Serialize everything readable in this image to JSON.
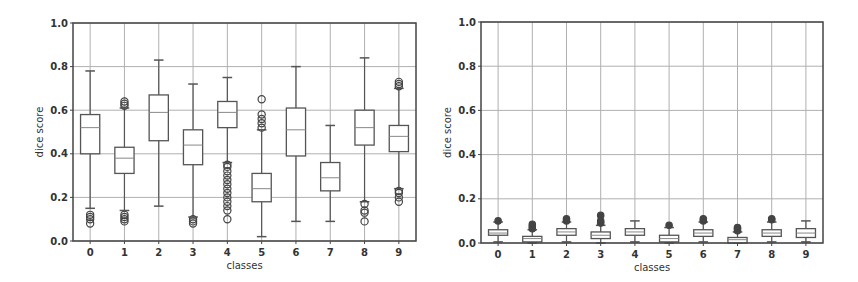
{
  "chart_data": [
    {
      "type": "box",
      "title": "",
      "xlabel": "classes",
      "ylabel": "dice score",
      "ylim": [
        0.0,
        1.0
      ],
      "yticks": [
        "0.0",
        "0.2",
        "0.4",
        "0.6",
        "0.8",
        "1.0"
      ],
      "categories": [
        "0",
        "1",
        "2",
        "3",
        "4",
        "5",
        "6",
        "7",
        "8",
        "9"
      ],
      "grid": true,
      "boxes": [
        {
          "class": "0",
          "whislo": 0.15,
          "q1": 0.4,
          "median": 0.52,
          "q3": 0.58,
          "whishi": 0.78,
          "fliers": [
            0.08,
            0.1,
            0.11,
            0.12
          ]
        },
        {
          "class": "1",
          "whislo": 0.14,
          "q1": 0.31,
          "median": 0.38,
          "q3": 0.43,
          "whishi": 0.61,
          "fliers": [
            0.09,
            0.1,
            0.11,
            0.12,
            0.62,
            0.63,
            0.64
          ]
        },
        {
          "class": "2",
          "whislo": 0.16,
          "q1": 0.46,
          "median": 0.59,
          "q3": 0.67,
          "whishi": 0.83,
          "fliers": []
        },
        {
          "class": "3",
          "whislo": 0.11,
          "q1": 0.35,
          "median": 0.44,
          "q3": 0.51,
          "whishi": 0.72,
          "fliers": [
            0.08,
            0.09,
            0.1
          ]
        },
        {
          "class": "4",
          "whislo": 0.36,
          "q1": 0.52,
          "median": 0.59,
          "q3": 0.64,
          "whishi": 0.75,
          "fliers": [
            0.1,
            0.14,
            0.16,
            0.18,
            0.2,
            0.22,
            0.24,
            0.26,
            0.28,
            0.3,
            0.32,
            0.34,
            0.35
          ]
        },
        {
          "class": "5",
          "whislo": 0.02,
          "q1": 0.18,
          "median": 0.24,
          "q3": 0.31,
          "whishi": 0.51,
          "fliers": [
            0.52,
            0.54,
            0.56,
            0.58,
            0.65
          ]
        },
        {
          "class": "6",
          "whislo": 0.09,
          "q1": 0.39,
          "median": 0.51,
          "q3": 0.61,
          "whishi": 0.8,
          "fliers": []
        },
        {
          "class": "7",
          "whislo": 0.09,
          "q1": 0.23,
          "median": 0.29,
          "q3": 0.36,
          "whishi": 0.53,
          "fliers": []
        },
        {
          "class": "8",
          "whislo": 0.18,
          "q1": 0.44,
          "median": 0.52,
          "q3": 0.6,
          "whishi": 0.84,
          "fliers": [
            0.09,
            0.13,
            0.14,
            0.17
          ]
        },
        {
          "class": "9",
          "whislo": 0.24,
          "q1": 0.41,
          "median": 0.48,
          "q3": 0.53,
          "whishi": 0.7,
          "fliers": [
            0.18,
            0.2,
            0.22,
            0.23,
            0.71,
            0.72,
            0.73
          ]
        }
      ]
    },
    {
      "type": "box",
      "title": "",
      "xlabel": "classes",
      "ylabel": "dice score",
      "ylim": [
        0.0,
        1.0
      ],
      "yticks": [
        "0.0",
        "0.2",
        "0.4",
        "0.6",
        "0.8",
        "1.0"
      ],
      "categories": [
        "0",
        "1",
        "2",
        "3",
        "4",
        "5",
        "6",
        "7",
        "8",
        "9"
      ],
      "grid": true,
      "boxes": [
        {
          "class": "0",
          "whislo": 0.005,
          "q1": 0.035,
          "median": 0.045,
          "q3": 0.06,
          "whishi": 0.095,
          "fliers": [
            0.1
          ]
        },
        {
          "class": "1",
          "whislo": 0.0,
          "q1": 0.005,
          "median": 0.02,
          "q3": 0.03,
          "whishi": 0.06,
          "fliers": [
            0.065,
            0.075,
            0.085
          ]
        },
        {
          "class": "2",
          "whislo": 0.005,
          "q1": 0.035,
          "median": 0.05,
          "q3": 0.065,
          "whishi": 0.095,
          "fliers": [
            0.1,
            0.11
          ]
        },
        {
          "class": "3",
          "whislo": 0.0,
          "q1": 0.02,
          "median": 0.035,
          "q3": 0.05,
          "whishi": 0.08,
          "fliers": [
            0.09,
            0.1,
            0.125
          ]
        },
        {
          "class": "4",
          "whislo": 0.005,
          "q1": 0.035,
          "median": 0.05,
          "q3": 0.065,
          "whishi": 0.1,
          "fliers": []
        },
        {
          "class": "5",
          "whislo": 0.0,
          "q1": 0.005,
          "median": 0.02,
          "q3": 0.035,
          "whishi": 0.07,
          "fliers": [
            0.08
          ]
        },
        {
          "class": "6",
          "whislo": 0.005,
          "q1": 0.03,
          "median": 0.045,
          "q3": 0.06,
          "whishi": 0.095,
          "fliers": [
            0.1,
            0.11
          ]
        },
        {
          "class": "7",
          "whislo": 0.0,
          "q1": 0.0,
          "median": 0.015,
          "q3": 0.025,
          "whishi": 0.05,
          "fliers": [
            0.055,
            0.065,
            0.07
          ]
        },
        {
          "class": "8",
          "whislo": 0.005,
          "q1": 0.03,
          "median": 0.045,
          "q3": 0.06,
          "whishi": 0.095,
          "fliers": [
            0.105,
            0.11
          ]
        },
        {
          "class": "9",
          "whislo": 0.005,
          "q1": 0.025,
          "median": 0.045,
          "q3": 0.065,
          "whishi": 0.1,
          "fliers": []
        }
      ]
    }
  ],
  "figures": [
    {
      "xlabel": "classes",
      "ylabel": "dice score"
    },
    {
      "xlabel": "classes",
      "ylabel": "dice score"
    }
  ],
  "colors": {
    "box_edge": "#555555",
    "grid": "#b0b0b0",
    "frame": "#444444",
    "flier": "#444444"
  }
}
